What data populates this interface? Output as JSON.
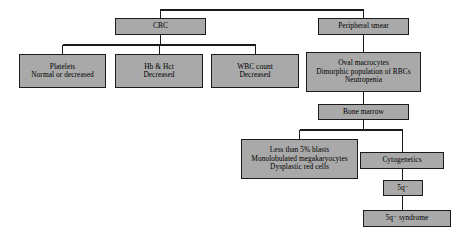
{
  "diagram": {
    "type": "flowchart",
    "orientation": "top-down",
    "colors": {
      "node_fill": "#a9a9a9",
      "node_border": "#1a1a1a",
      "connector": "#1a1a1a",
      "background": "#ffffff",
      "text": "#000000"
    },
    "nodes": [
      {
        "id": "cbc",
        "lines": [
          "CBC"
        ],
        "x": 115,
        "y": 18,
        "w": 91,
        "h": 17
      },
      {
        "id": "peripheral-smear",
        "lines": [
          "Peripheral smear"
        ],
        "x": 318,
        "y": 18,
        "w": 91,
        "h": 17
      },
      {
        "id": "platelets",
        "lines": [
          "Platelets",
          "Normal or decreased"
        ],
        "x": 19,
        "y": 54,
        "w": 87,
        "h": 34
      },
      {
        "id": "hb-hct",
        "lines": [
          "Hb & Hct",
          "Decreased"
        ],
        "x": 115,
        "y": 54,
        "w": 88,
        "h": 34
      },
      {
        "id": "wbc-count",
        "lines": [
          "WBC count",
          "Decreased"
        ],
        "x": 211,
        "y": 54,
        "w": 88,
        "h": 34
      },
      {
        "id": "oval-macrocytes",
        "lines": [
          "Oval macrocytes",
          "Dimorphic population of RBCs",
          "Neutropenia"
        ],
        "x": 306,
        "y": 52,
        "w": 115,
        "h": 40
      },
      {
        "id": "bone-marrow",
        "lines": [
          "Bone marrow"
        ],
        "x": 318,
        "y": 104,
        "w": 91,
        "h": 16
      },
      {
        "id": "less-than-5-blasts",
        "lines": [
          "Less than 5% blasts",
          "Monolobulated megakaryocytes",
          "Dysplastic red cells"
        ],
        "x": 241,
        "y": 139,
        "w": 117,
        "h": 40
      },
      {
        "id": "cytogenetics",
        "lines": [
          "Cytogenetics"
        ],
        "x": 360,
        "y": 152,
        "w": 84,
        "h": 17
      },
      {
        "id": "5q-minus",
        "lines": [
          "5q⁻"
        ],
        "x": 383,
        "y": 180,
        "w": 40,
        "h": 16
      },
      {
        "id": "5q-minus-syndrome",
        "lines": [
          "5q⁻ syndrome"
        ],
        "x": 363,
        "y": 210,
        "w": 88,
        "h": 17
      }
    ],
    "connectors": [
      {
        "id": "root-to-cbc-and-smear",
        "description": "root bus splitting to CBC and Peripheral smear"
      },
      {
        "id": "cbc-to-platelets",
        "description": "CBC to Platelets"
      },
      {
        "id": "cbc-to-hb-hct",
        "description": "CBC to Hb & Hct"
      },
      {
        "id": "cbc-to-wbc-count",
        "description": "CBC to WBC count"
      },
      {
        "id": "smear-to-oval-macrocytes",
        "description": "Peripheral smear to Oval macrocytes"
      },
      {
        "id": "oval-macrocytes-to-bone-marrow",
        "description": "Oval macrocytes to Bone marrow"
      },
      {
        "id": "bone-marrow-to-blasts",
        "description": "Bone marrow to Less than 5% blasts"
      },
      {
        "id": "bone-marrow-to-cytogenetics",
        "description": "Bone marrow to Cytogenetics"
      },
      {
        "id": "cytogenetics-to-5q",
        "description": "Cytogenetics to 5q-"
      },
      {
        "id": "5q-to-syndrome",
        "description": "5q- to 5q- syndrome"
      }
    ]
  }
}
